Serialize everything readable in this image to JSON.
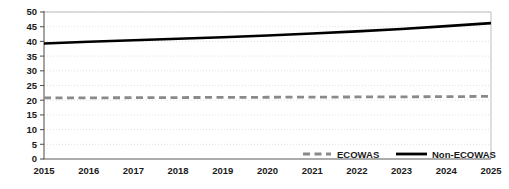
{
  "chart_data": {
    "type": "line",
    "title": "",
    "subtitle": "",
    "xlabel": "",
    "ylabel": "",
    "x": [
      2015,
      2016,
      2017,
      2018,
      2019,
      2020,
      2021,
      2022,
      2023,
      2024,
      2025
    ],
    "categories": [
      "2015",
      "2016",
      "2017",
      "2018",
      "2019",
      "2020",
      "2021",
      "2022",
      "2023",
      "2024",
      "2025"
    ],
    "series": [
      {
        "name": "ECOWAS",
        "style": "dashed",
        "color": "#8a8a8a",
        "values": [
          20.8,
          20.8,
          20.85,
          20.9,
          20.95,
          21.0,
          21.05,
          21.1,
          21.15,
          21.2,
          21.3
        ]
      },
      {
        "name": "Non-ECOWAS",
        "style": "solid",
        "color": "#000000",
        "values": [
          39.3,
          39.9,
          40.4,
          40.9,
          41.4,
          42.0,
          42.7,
          43.4,
          44.2,
          45.2,
          46.2
        ]
      }
    ],
    "ylim": [
      0,
      50
    ],
    "ytick_step": 5,
    "yticks": [
      "50",
      "45",
      "40",
      "35",
      "30",
      "25",
      "20",
      "15",
      "10",
      "5",
      "0"
    ],
    "xlim": [
      2015,
      2025
    ],
    "grid": "horizontal-dotted",
    "legend_position": "inside-bottom-right",
    "legend": [
      {
        "label": "ECOWAS",
        "marker": "dashed-line",
        "color": "#8a8a8a"
      },
      {
        "label": "Non-ECOWAS",
        "marker": "solid-line",
        "color": "#000000"
      }
    ],
    "background_color": "#ffffff",
    "gridline_color": "#d8d8d8",
    "axis_color": "#5a5a5a"
  }
}
